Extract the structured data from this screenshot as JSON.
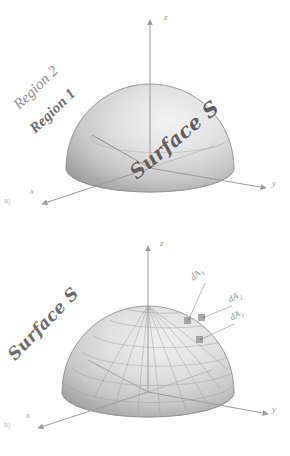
{
  "figure": {
    "background": "#ffffff",
    "ink_color": "#8a8a8a",
    "surface_fill_light": "#e7e7e7",
    "surface_fill_dark": "#9d9d9d",
    "panels": [
      {
        "id": "a",
        "panel_label": "a)",
        "axes": {
          "x": "x",
          "y": "y",
          "z": "z"
        },
        "labels": {
          "region_outer": "Region 2",
          "region_inner": "Region 1",
          "surface": "Surface S"
        }
      },
      {
        "id": "b",
        "panel_label": "b)",
        "axes": {
          "x": "x",
          "y": "y",
          "z": "z"
        },
        "labels": {
          "surface": "Surface S",
          "area_element_1": "dA",
          "area_element_1_sub": "3",
          "area_element_2": "dA",
          "area_element_2_sub": "2",
          "area_element_3": "dA",
          "area_element_3_sub": "1"
        }
      }
    ]
  }
}
